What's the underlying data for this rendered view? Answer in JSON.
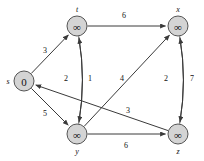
{
  "figure": {
    "background_color": "#ffffff",
    "node_fill": "#d4d4d4",
    "node_stroke": "#555555",
    "edge_color": "#3a3a3a",
    "text_color": "#111111"
  },
  "chart_data": {
    "type": "diagram",
    "diagram_kind": "directed-weighted-graph",
    "title": "",
    "nodes": [
      {
        "id": "s",
        "label": "s",
        "value": "0",
        "x": 24,
        "y": 81,
        "label_dx": -16,
        "label_dy": 0
      },
      {
        "id": "t",
        "label": "t",
        "value": "∞",
        "x": 77,
        "y": 26,
        "label_dx": 0,
        "label_dy": -17
      },
      {
        "id": "x",
        "label": "x",
        "value": "∞",
        "x": 178,
        "y": 26,
        "label_dx": 0,
        "label_dy": -17
      },
      {
        "id": "y",
        "label": "y",
        "value": "∞",
        "x": 77,
        "y": 134,
        "label_dx": 0,
        "label_dy": 17
      },
      {
        "id": "z",
        "label": "z",
        "value": "∞",
        "x": 178,
        "y": 134,
        "label_dx": 0,
        "label_dy": 17
      }
    ],
    "edges": [
      {
        "from": "s",
        "to": "t",
        "weight": "3",
        "wx": 45,
        "wy": 50
      },
      {
        "from": "s",
        "to": "y",
        "weight": "5",
        "wx": 45,
        "wy": 113
      },
      {
        "from": "t",
        "to": "x",
        "weight": "6",
        "wx": 124,
        "wy": 15
      },
      {
        "from": "t",
        "to": "y",
        "weight": "2",
        "wx": 66,
        "wy": 78
      },
      {
        "from": "y",
        "to": "t",
        "weight": "1",
        "wx": 90,
        "wy": 78
      },
      {
        "from": "y",
        "to": "x",
        "weight": "4",
        "wx": 122,
        "wy": 78
      },
      {
        "from": "y",
        "to": "z",
        "weight": "6",
        "wx": 126,
        "wy": 145
      },
      {
        "from": "x",
        "to": "z",
        "weight": "2",
        "wx": 166,
        "wy": 78
      },
      {
        "from": "z",
        "to": "x",
        "weight": "7",
        "wx": 192,
        "wy": 78
      },
      {
        "from": "z",
        "to": "s",
        "weight": "3",
        "wx": 128,
        "wy": 110
      }
    ],
    "node_radius": 10,
    "legend": [],
    "grid": false
  }
}
